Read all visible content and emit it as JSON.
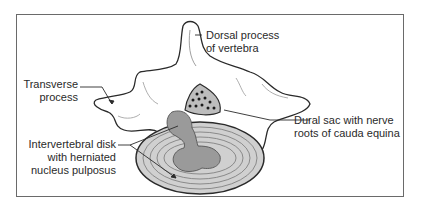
{
  "figure": {
    "labels": {
      "dorsal_process": {
        "line1": "Dorsal process",
        "line2": "of vertebra"
      },
      "transverse_process": {
        "line1": "Transverse",
        "line2": "process"
      },
      "dural_sac": {
        "line1": "Dural sac with nerve",
        "line2": "roots of cauda equina"
      },
      "intervertebral_disk": {
        "line1": "Intervertebral disk",
        "line2": "with herniated",
        "line3": "nucleus pulposus"
      }
    },
    "colors": {
      "frame": "#6a6a6a",
      "outline": "#2a2a2a",
      "disk_fill": "#c8c8c8",
      "nucleus_fill": "#9a9a9a",
      "text": "#2a2a2a"
    }
  }
}
